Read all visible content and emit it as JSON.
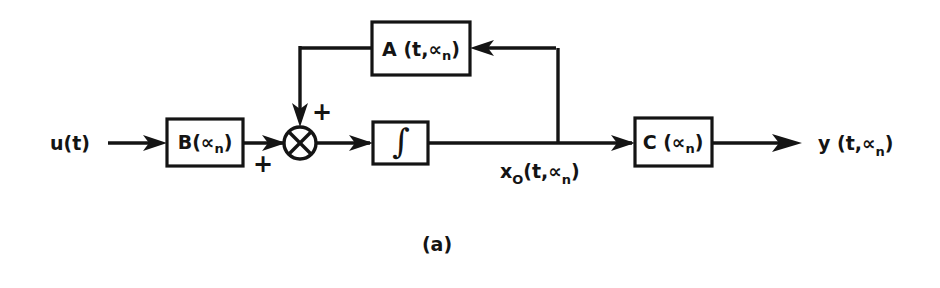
{
  "figure": {
    "caption": "(a)",
    "background_color": "#ffffff",
    "ink_color": "#141414",
    "type": "control-system-block-diagram"
  },
  "signals": {
    "input": {
      "label_base": "u(t)",
      "name": "input-signal"
    },
    "state": {
      "label_prefix": "x",
      "label_subscript": "O",
      "label_suffix": "(t,∝",
      "label_sub2": "n",
      "label_end": ")",
      "full": "x_O(t,∝_n)"
    },
    "output": {
      "label_prefix": "y (t,∝",
      "label_subscript": "n",
      "label_suffix": ")",
      "full": "y(t,∝_n)"
    }
  },
  "blocks": [
    {
      "id": "feedback-gain",
      "name": "block-a",
      "label_prefix": "A (t,∝",
      "label_subscript": "n",
      "label_suffix": ")",
      "full_label": "A(t,∝_n)",
      "role": "feedback-matrix"
    },
    {
      "id": "input-gain",
      "name": "block-b",
      "label_prefix": "B(∝",
      "label_subscript": "n",
      "label_suffix": ")",
      "full_label": "B(∝_n)",
      "role": "input-matrix"
    },
    {
      "id": "output-gain",
      "name": "block-c",
      "label_prefix": "C (∝",
      "label_subscript": "n",
      "label_suffix": ")",
      "full_label": "C(∝_n)",
      "role": "output-matrix"
    },
    {
      "id": "integrator",
      "name": "block-integrator",
      "full_label": "∫",
      "role": "integrator"
    }
  ],
  "summing_junction": {
    "name": "summing-junction",
    "symbol": "crossed-circle",
    "signs": {
      "feedback_input": "+",
      "forward_input": "+"
    }
  }
}
